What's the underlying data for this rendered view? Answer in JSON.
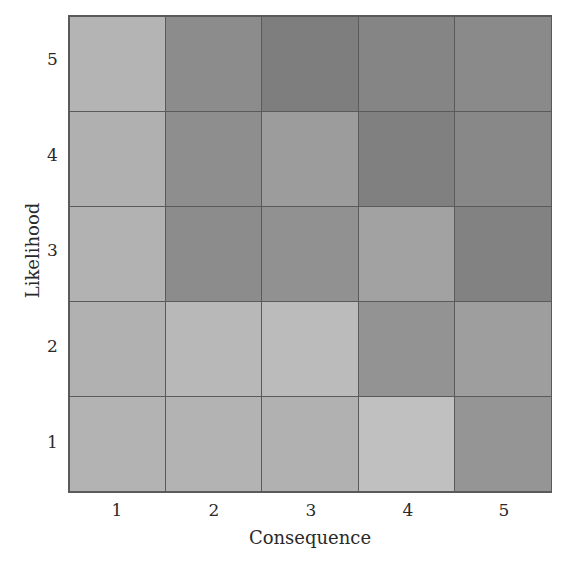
{
  "chart_data": {
    "type": "heatmap",
    "title": "",
    "xlabel": "Consequence",
    "ylabel": "Likelihood",
    "x": [
      "1",
      "2",
      "3",
      "4",
      "5"
    ],
    "y": [
      "5",
      "4",
      "3",
      "2",
      "1"
    ],
    "shades": [
      [
        "#b4b4b4",
        "#8c8c8c",
        "#7e7e7e",
        "#858585",
        "#8a8a8a"
      ],
      [
        "#b0b0b0",
        "#8e8e8e",
        "#9c9c9c",
        "#808080",
        "#888888"
      ],
      [
        "#b2b2b2",
        "#8c8c8c",
        "#919191",
        "#a2a2a2",
        "#828282"
      ],
      [
        "#b1b1b1",
        "#b8b8b8",
        "#bbbbbb",
        "#939393",
        "#9e9e9e"
      ],
      [
        "#b3b3b3",
        "#b3b3b3",
        "#b1b1b1",
        "#c0c0c0",
        "#959595"
      ]
    ],
    "grid": true,
    "legend": "none"
  }
}
